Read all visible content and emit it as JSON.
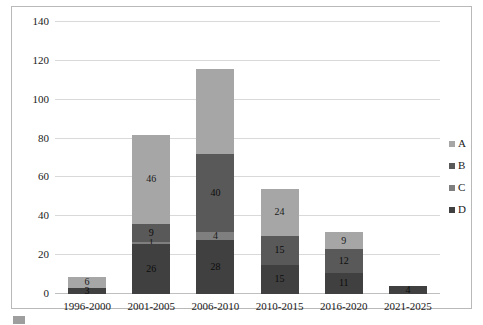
{
  "chart_data": {
    "type": "bar",
    "stacked": true,
    "title": "",
    "subtitle": "",
    "xlabel": "",
    "ylabel": "",
    "categories": [
      "1996-2000",
      "2001-2005",
      "2006-2010",
      "2010-2015",
      "2016-2020",
      "2021-2025"
    ],
    "series": [
      {
        "name": "A",
        "color": "#a6a6a6",
        "values": [
          6,
          46,
          44,
          24,
          9,
          0
        ]
      },
      {
        "name": "B",
        "color": "#595959",
        "values": [
          0,
          9,
          40,
          15,
          12,
          0
        ]
      },
      {
        "name": "C",
        "color": "#7f7f7f",
        "values": [
          0,
          1,
          4,
          0,
          0,
          0
        ]
      },
      {
        "name": "D",
        "color": "#404040",
        "values": [
          3,
          26,
          28,
          15,
          11,
          4
        ]
      }
    ],
    "stack_order_bottom_to_top": [
      "D",
      "C",
      "B",
      "A"
    ],
    "totals": [
      10,
      82,
      116,
      54,
      32,
      4
    ],
    "ylim": [
      0,
      140
    ],
    "yticks": [
      0,
      20,
      40,
      60,
      80,
      100,
      120,
      140
    ],
    "ytick_labels": [
      "0",
      "20",
      "40",
      "60",
      "80",
      "100",
      "120",
      "140"
    ],
    "grid": true,
    "legend_position": "right",
    "data_labels": {
      "1996-2000": {
        "A": "6",
        "D": "3"
      },
      "2001-2005": {
        "A": "46",
        "B": "9",
        "C": "1",
        "D": "26"
      },
      "2006-2010": {
        "A": "",
        "B": "40",
        "C": "4",
        "D": "28"
      },
      "2010-2015": {
        "A": "24",
        "B": "15",
        "D": "15"
      },
      "2016-2020": {
        "A": "9",
        "B": "12",
        "D": "11"
      },
      "2021-2025": {
        "D": "4"
      }
    }
  },
  "legend": {
    "items": [
      {
        "label": "A",
        "color": "#a6a6a6"
      },
      {
        "label": "B",
        "color": "#595959"
      },
      {
        "label": "C",
        "color": "#7f7f7f"
      },
      {
        "label": "D",
        "color": "#404040"
      }
    ]
  },
  "caption": {
    "text": ""
  }
}
